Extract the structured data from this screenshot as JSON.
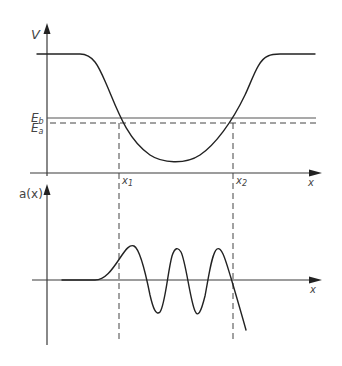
{
  "figure": {
    "colors": {
      "curve": "#222222",
      "axis": "#3a3a3a",
      "level_line": "#555555",
      "dashed": "#444444",
      "background": "#ffffff"
    },
    "top_plot": {
      "y_axis_label": "V",
      "x_axis_label": "x",
      "levels": [
        {
          "name": "E_b",
          "main": "E",
          "sub": "b",
          "style": "solid",
          "y": 118
        },
        {
          "name": "E_a",
          "main": "E",
          "sub": "a",
          "style": "dashed",
          "y": 123
        }
      ],
      "turning_points": [
        {
          "main": "x",
          "sub": "1",
          "x": 119
        },
        {
          "main": "x",
          "sub": "2",
          "x": 233
        }
      ],
      "potential_path": "M 37 54 L 80 54 C 95 54, 100 70, 108 88 C 118 112, 128 140, 150 155 C 162 163, 185 165, 200 155 C 215 145, 232 122, 245 95 C 253 78, 258 60, 268 56 C 272 54, 276 54, 280 54 L 315 54"
    },
    "bottom_plot": {
      "y_axis_label": "a(x)",
      "x_axis_label": "x",
      "wavefunction_path": "M 62 280 L 95 280 C 105 280, 112 270, 120 258 C 126 249, 130 244, 134 246 C 140 249, 146 275, 150 295 C 153 308, 156 316, 160 312 C 165 306, 168 270, 172 256 C 175 247, 178 247, 181 252 C 186 262, 190 300, 195 311 C 198 318, 201 312, 205 296 C 209 275, 212 252, 217 249 C 222 246, 226 262, 231 278 C 236 295, 241 312, 246 330"
    }
  }
}
